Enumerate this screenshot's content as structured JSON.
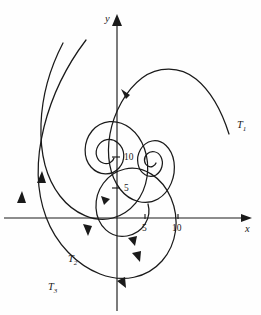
{
  "figure": {
    "type": "phase-portrait",
    "background_color": "#fefefe",
    "ink_color": "#1a1a1a",
    "width": 261,
    "height": 315
  },
  "axes": {
    "x_axis": {
      "label": "x",
      "label_x": 245,
      "label_y": 232,
      "start_x": 4,
      "end_x": 252,
      "y_pixel": 218,
      "ticks": [
        {
          "value": "5",
          "x_pixel": 145,
          "label_x": 142,
          "label_y": 231
        },
        {
          "value": "10",
          "x_pixel": 178,
          "label_x": 172,
          "label_y": 231
        }
      ]
    },
    "y_axis": {
      "label": "y",
      "label_x": 105,
      "label_y": 22,
      "x_pixel": 117,
      "start_y": 311,
      "end_y": 14,
      "ticks": [
        {
          "value": "5",
          "y_pixel": 188,
          "label_x": 124,
          "label_y": 191
        },
        {
          "value": "10",
          "y_pixel": 157,
          "label_x": 124,
          "label_y": 160
        }
      ]
    },
    "origin": {
      "x": 117,
      "y": 218
    }
  },
  "chart_data": {
    "type": "line",
    "title": "",
    "xlabel": "x",
    "ylabel": "y",
    "xlim": [
      -17,
      22
    ],
    "ylim": [
      -15,
      33
    ],
    "grid": false,
    "legend": "inline-curve-labels",
    "series": [
      {
        "name": "T1",
        "label": "T₁",
        "label_x": 237,
        "label_y": 128
      },
      {
        "name": "T2",
        "label": "T₂",
        "label_x": 68,
        "label_y": 262
      },
      {
        "name": "T3",
        "label": "T₃",
        "label_x": 48,
        "label_y": 290
      }
    ]
  },
  "curves": {
    "t1": {
      "name": "T1",
      "path": "M 229,134 C 222,112 212,92 196,79 C 180,66 158,66 142,78 C 126,90 114,112 110,134 C 106,156 110,176 120,189 C 130,202 146,206 158,199 C 170,192 176,176 174,162 C 172,148 162,139 152,141 C 142,143 136,154 138,164 C 140,174 149,179 156,175 C 162,171 164,163 161,157 C 158,151 151,150 147,154 C 143,158 144,164 148,166 C 151,168 155,166 156,163"
    },
    "t2": {
      "name": "T2",
      "path": "M 63,43 C 50,68 42,96 41,124 C 40,152 46,178 60,196 C 74,214 95,223 113,218 C 131,213 144,197 147,177 C 150,157 143,138 130,128 C 117,118 101,120 92,131 C 83,142 83,158 91,167 C 99,176 112,176 119,168 C 126,160 125,149 118,143 C 111,137 102,139 98,146 C 94,153 97,161 103,163 C 108,165 113,162 114,158"
    },
    "t3": {
      "name": "T3",
      "path": "M 86,40 C 67,65 52,95 44,127 C 36,159 36,190 46,217 C 56,244 77,265 100,274 C 123,283 147,278 162,261 C 177,244 180,219 171,198 C 162,177 143,165 125,169 C 107,173 95,190 96,208 C 97,226 111,239 127,236 C 143,233 152,218 148,204"
    }
  },
  "arrows": {
    "x_axis_tip": {
      "name": "x-axis-arrowhead",
      "points": "252,218 241,214 241,222"
    },
    "y_axis_tip": {
      "name": "y-axis-arrowhead",
      "points": "117,14 112,26 122,26"
    },
    "on_curves": [
      {
        "name": "arrowhead-t1-upleft",
        "points": "121,89 130,95 126,99",
        "rotate": ""
      },
      {
        "name": "arrowhead-t2-up",
        "points": "42,171 46,183 37,183"
      },
      {
        "name": "arrowhead-t3-up",
        "points": "22,191 26,203 17,203"
      },
      {
        "name": "arrowhead-inner-left",
        "points": "101,196 110,199 104,205"
      },
      {
        "name": "arrowhead-t2-down",
        "points": "88,236 83,224 92,226"
      },
      {
        "name": "arrowhead-spiral-down",
        "points": "140,262 132,253 141,251"
      },
      {
        "name": "arrowhead-spiral-lower",
        "points": "126,288 117,281 125,277"
      },
      {
        "name": "arrowhead-inner-down",
        "points": "135,246 128,238 137,236"
      }
    ]
  }
}
